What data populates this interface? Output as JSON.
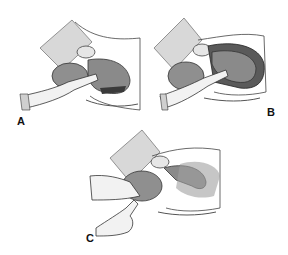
{
  "figure": {
    "panels": [
      {
        "id": "A",
        "label": "A",
        "description": "Hand inserted to flex fetal head, maternal pelvis cross-section"
      },
      {
        "id": "B",
        "label": "B",
        "description": "Hand supporting fetal head with fetus in uterus"
      },
      {
        "id": "C",
        "label": "C",
        "description": "Fingers applying pressure at fetal head near pelvic outlet"
      }
    ],
    "colors": {
      "background": "#ffffff",
      "tissue_gray": "#8a8a8a",
      "tissue_dark": "#4a4a4a",
      "skin_light": "#efefef",
      "outline": "#333333",
      "shading": "#bdbdbd"
    }
  }
}
